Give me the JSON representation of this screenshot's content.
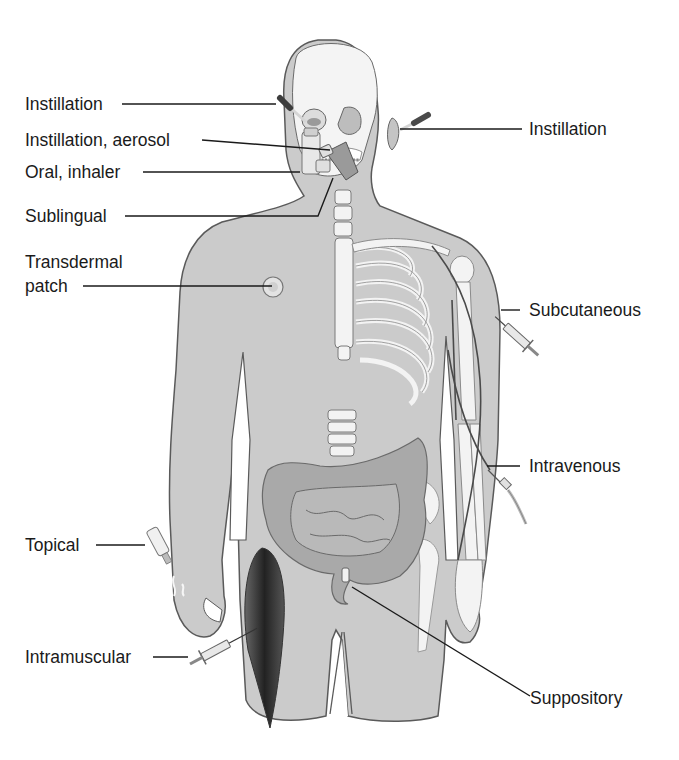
{
  "diagram": {
    "colors": {
      "skin": "#c9c9c9",
      "skin_light": "#d8d8d8",
      "outline": "#555555",
      "bone": "#f2f2f2",
      "organ": "#a9a9a9",
      "muscle": "#3a3a3a",
      "leader_line": "#1a1a1a",
      "text": "#1a1a1a"
    },
    "labels": [
      {
        "id": "instillation-eye",
        "text": "Instillation",
        "side": "left"
      },
      {
        "id": "instillation-aerosol",
        "text": "Instillation, aerosol",
        "side": "left"
      },
      {
        "id": "oral-inhaler",
        "text": "Oral, inhaler",
        "side": "left"
      },
      {
        "id": "sublingual",
        "text": "Sublingual",
        "side": "left"
      },
      {
        "id": "transdermal-line1",
        "text": "Transdermal",
        "side": "left"
      },
      {
        "id": "transdermal-line2",
        "text": "patch",
        "side": "left"
      },
      {
        "id": "topical",
        "text": "Topical",
        "side": "left"
      },
      {
        "id": "intramuscular",
        "text": "Intramuscular",
        "side": "left"
      },
      {
        "id": "instillation-ear",
        "text": "Instillation",
        "side": "right"
      },
      {
        "id": "subcutaneous",
        "text": "Subcutaneous",
        "side": "right"
      },
      {
        "id": "intravenous",
        "text": "Intravenous",
        "side": "right"
      },
      {
        "id": "suppository",
        "text": "Suppository",
        "side": "right"
      }
    ]
  }
}
